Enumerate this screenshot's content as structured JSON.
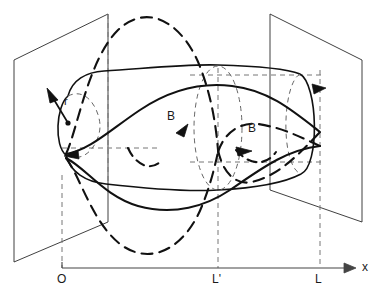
{
  "figure": {
    "type": "3d-line-diagram",
    "background_color": "#ffffff",
    "stroke_color": "#1a1a1a",
    "thin_stroke_color": "#555555"
  },
  "axis": {
    "name": "x-axis",
    "label": "x",
    "origin_label": "O",
    "ticks": [
      {
        "id": "origin",
        "label": "O",
        "x": 62
      },
      {
        "id": "l-prime",
        "label": "L'",
        "x": 218
      },
      {
        "id": "l",
        "label": "L",
        "x": 320
      }
    ],
    "arrow": "right"
  },
  "vectors": [
    {
      "id": "radius-vector",
      "label": "r",
      "description": "radius vector on left cap"
    },
    {
      "id": "field-vector-back",
      "label": "B",
      "description": "magnetic field direction on dashed (rear) field line"
    },
    {
      "id": "field-vector-front",
      "label": "B",
      "description": "magnetic field direction on solid (front) field line"
    }
  ],
  "planes": [
    {
      "id": "left-plane",
      "label": "",
      "position": "L'"
    },
    {
      "id": "right-plane",
      "label": "",
      "position": "L"
    }
  ],
  "tube": {
    "id": "flux-tube",
    "description": "magnetic flux tube with elliptical end caps and helical field lines"
  }
}
